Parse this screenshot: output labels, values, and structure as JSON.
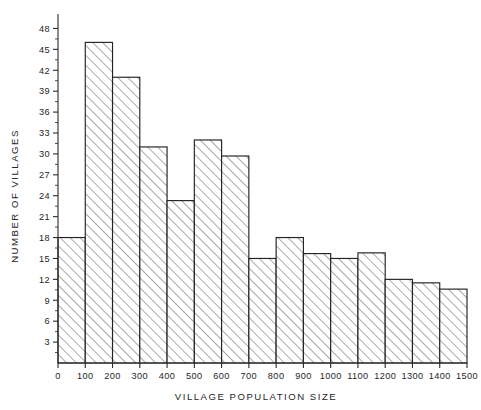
{
  "chart_data": {
    "type": "bar",
    "title": "",
    "subtitle": "",
    "xlabel": "VILLAGE POPULATION SIZE",
    "ylabel": "NUMBER OF VILLAGES",
    "categories": [
      "0-100",
      "100-200",
      "200-300",
      "300-400",
      "400-500",
      "500-600",
      "600-700",
      "700-800",
      "800-900",
      "900-1000",
      "1000-1100",
      "1100-1200",
      "1200-1300",
      "1300-1400",
      "1400-1500"
    ],
    "bin_edges": [
      0,
      100,
      200,
      300,
      400,
      500,
      600,
      700,
      800,
      900,
      1000,
      1100,
      1200,
      1300,
      1400,
      1500
    ],
    "values": [
      18,
      46,
      41,
      31,
      23.3,
      32,
      29.7,
      15,
      18,
      15.7,
      15,
      15.8,
      12,
      11.5,
      10.6
    ],
    "xlim": [
      0,
      1500
    ],
    "ylim": [
      0,
      49.5
    ],
    "x_ticks": [
      0,
      100,
      200,
      300,
      400,
      500,
      600,
      700,
      800,
      900,
      1000,
      1100,
      1200,
      1300,
      1400,
      1500
    ],
    "x_tick_labels": [
      "0",
      "100",
      "200",
      "300",
      "400",
      "500",
      "600",
      "700",
      "800",
      "900",
      "1000",
      "1100",
      "1200",
      "1300",
      "1400",
      "1500"
    ],
    "y_ticks": [
      3,
      6,
      9,
      12,
      15,
      18,
      21,
      24,
      27,
      30,
      33,
      36,
      39,
      42,
      45,
      48
    ],
    "y_tick_labels": [
      "3",
      "6",
      "9",
      "12",
      "15",
      "18",
      "21",
      "24",
      "27",
      "30",
      "33",
      "36",
      "39",
      "42",
      "45",
      "48"
    ],
    "y_minor_step": 1.5,
    "grid": false,
    "legend": null,
    "bar_style": "hatched-diagonal",
    "colors": {
      "axis": "#2a2a2a",
      "bar_outline": "#232323",
      "bar_fill": "#ffffff",
      "hatch": "#555555",
      "text": "#262626",
      "background": "#ffffff"
    }
  },
  "axis_labels": {
    "x_title": "VILLAGE POPULATION SIZE",
    "y_title": "NUMBER OF VILLAGES"
  }
}
